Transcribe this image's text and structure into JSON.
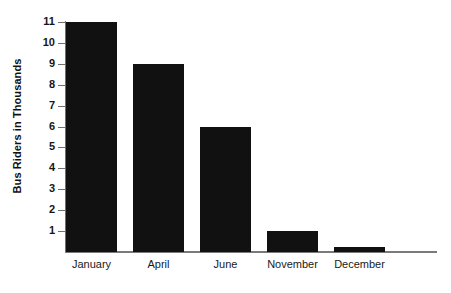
{
  "chart_data": {
    "type": "bar",
    "title": "",
    "subtitle": "",
    "xlabel": "",
    "ylabel": "Bus Riders in Thousands",
    "categories": [
      "January",
      "April",
      "June",
      "November",
      "December"
    ],
    "values": [
      11,
      9,
      6,
      1,
      0.25
    ],
    "series": [
      {
        "name": "Bus Riders",
        "values": [
          11,
          9,
          6,
          1,
          0.25
        ]
      }
    ],
    "ylim": [
      0,
      11
    ],
    "y_ticks": [
      1,
      2,
      3,
      4,
      5,
      6,
      7,
      8,
      9,
      10,
      11
    ],
    "y_tick_labels": [
      "1",
      "2",
      "3",
      "4",
      "5",
      "6",
      "7",
      "8",
      "9",
      "10",
      "11"
    ],
    "grid": false,
    "legend": false,
    "legend_position": "none",
    "bar_color": "#111111",
    "axis_color": "#6f6f6f",
    "background_color": "#ffffff"
  }
}
